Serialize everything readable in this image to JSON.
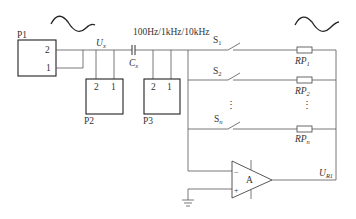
{
  "diagram": {
    "components": {
      "p1": {
        "name": "P1",
        "pin_top": "2",
        "pin_bottom": "1"
      },
      "p2": {
        "name": "P2",
        "pin_left": "2",
        "pin_right": "1"
      },
      "p3": {
        "name": "P3",
        "pin_left": "2",
        "pin_right": "1"
      },
      "ux": {
        "main": "U",
        "sub": "x"
      },
      "cx": {
        "main": "C",
        "sub": "x"
      },
      "freq": "100Hz/1kHz/10kHz",
      "switches": [
        {
          "main": "S",
          "sub": "1"
        },
        {
          "main": "S",
          "sub": "2"
        },
        {
          "main": "S",
          "sub": "n"
        }
      ],
      "resistors": [
        {
          "main": "RP",
          "sub": "1"
        },
        {
          "main": "RP",
          "sub": "2"
        },
        {
          "main": "RP",
          "sub": "n"
        }
      ],
      "ellipsis": "⋮",
      "amp": {
        "name": "A",
        "minus": "−",
        "plus": "+"
      },
      "output": {
        "main": "U",
        "sub": "R1"
      }
    },
    "signals": [
      "sine-wave-input",
      "sine-wave-output"
    ]
  }
}
